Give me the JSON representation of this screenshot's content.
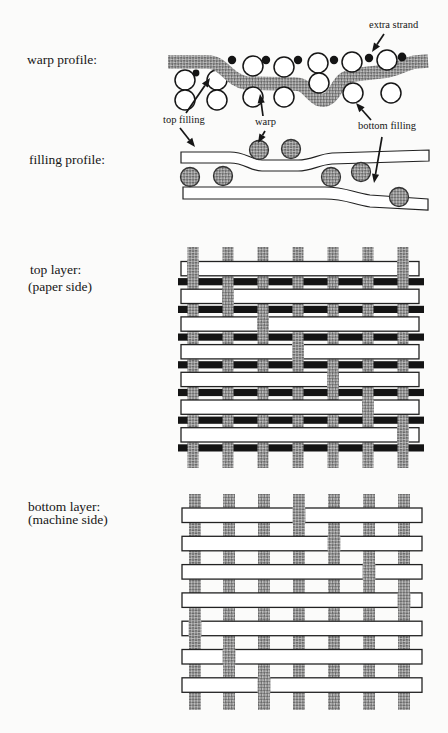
{
  "page": {
    "background": "#fbfbfa"
  },
  "colors": {
    "hatch_light": "#bdbdbd",
    "hatch_dark": "#6a6a6a",
    "ink": "#161616",
    "outline": "#222222",
    "white": "#ffffff",
    "extra_strand_black": "#141414"
  },
  "sections": {
    "warp_profile": {
      "label": "warp profile:"
    },
    "filling_profile": {
      "label": "filling profile:"
    },
    "top_layer": {
      "label": "top layer:",
      "sublabel": "(paper side)"
    },
    "bottom_layer": {
      "label": "bottom layer:",
      "sublabel": "(machine side)"
    }
  },
  "annotations": {
    "extra_strand": "extra strand",
    "top_filling": "top filling",
    "warp": "warp",
    "bottom_filling": "bottom filling"
  },
  "weaves": {
    "top_layer": {
      "warp_columns": 7,
      "filling_bands": 7,
      "extra_strands": 7,
      "warp_over_filling_crossings": [
        [
          1,
          1
        ],
        [
          1,
          7
        ],
        [
          2,
          2
        ],
        [
          3,
          3
        ],
        [
          4,
          4
        ],
        [
          5,
          5
        ],
        [
          6,
          6
        ],
        [
          7,
          7
        ]
      ],
      "warp_over_extra_strands": "all-columns"
    },
    "bottom_layer": {
      "warp_columns": 7,
      "filling_bands": 7,
      "warp_over_filling_crossings": [
        [
          1,
          4
        ],
        [
          2,
          5
        ],
        [
          3,
          6
        ],
        [
          4,
          7
        ],
        [
          5,
          1
        ],
        [
          6,
          2
        ],
        [
          7,
          3
        ]
      ]
    }
  }
}
